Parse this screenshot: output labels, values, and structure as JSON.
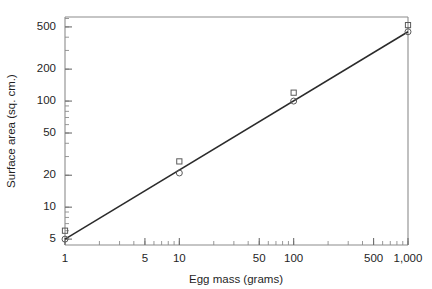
{
  "chart_data": {
    "type": "scatter",
    "title": "",
    "xlabel": "Egg mass (grams)",
    "ylabel": "Surface area (sq. cm.)",
    "xscale": "log",
    "yscale": "log",
    "xlim": [
      1,
      1000
    ],
    "ylim": [
      4.4,
      620
    ],
    "grid": false,
    "legend": "none",
    "xticks": [
      1,
      5,
      10,
      50,
      100,
      500,
      1000
    ],
    "xticklabels": [
      "1",
      "5",
      "10",
      "50",
      "100",
      "500",
      "1,000"
    ],
    "yticks": [
      5,
      10,
      20,
      50,
      100,
      200,
      500
    ],
    "yticklabels": [
      "5",
      "10",
      "20",
      "50",
      "100",
      "200",
      "500"
    ],
    "x": [
      1,
      10,
      100,
      1000
    ],
    "series": [
      {
        "name": "square-marker",
        "marker": "open-square",
        "values": [
          6.0,
          27.0,
          120.0,
          520.0
        ]
      },
      {
        "name": "circle-marker",
        "marker": "open-circle",
        "values": [
          5.0,
          21.0,
          100.0,
          450.0
        ]
      }
    ],
    "fit_line": {
      "name": "regression-line",
      "x": [
        1,
        1000
      ],
      "y": [
        5.0,
        450.0
      ],
      "equation": "S = 4.95 x M^0.652"
    },
    "colors": {
      "line": "#2b2b2b",
      "marker": "#5a5a5a",
      "axis": "#8c8c8c",
      "text": "#1f1f1f",
      "background": "#ffffff"
    }
  }
}
